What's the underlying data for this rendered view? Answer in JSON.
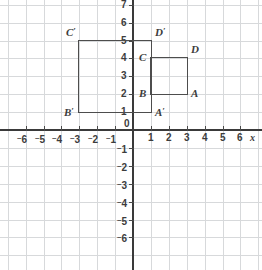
{
  "chart_data": {
    "type": "scatter",
    "title": "",
    "xlabel": "x",
    "ylabel": "",
    "grid": true,
    "legend": null,
    "xlim": [
      -7,
      7
    ],
    "ylim": [
      -7,
      7
    ],
    "x_ticks": [
      "-6",
      "-5",
      "-4",
      "-3",
      "-2",
      "-1",
      "0",
      "1",
      "2",
      "3",
      "4",
      "5",
      "6"
    ],
    "y_ticks": [
      "7",
      "6",
      "5",
      "4",
      "3",
      "2",
      "1",
      "-1",
      "-2",
      "-3",
      "-4",
      "-5",
      "-6"
    ],
    "shapes": [
      {
        "name": "image-square-primed",
        "kind": "rectangle",
        "x_min": -3,
        "x_max": 1,
        "y_min": 1,
        "y_max": 5,
        "vertices": [
          {
            "label": "B",
            "prime": true,
            "x": -3,
            "y": 1
          },
          {
            "label": "C",
            "prime": true,
            "x": -3,
            "y": 5
          },
          {
            "label": "D",
            "prime": true,
            "x": 1,
            "y": 5
          },
          {
            "label": "A",
            "prime": true,
            "x": 1,
            "y": 1
          }
        ]
      },
      {
        "name": "preimage-square",
        "kind": "rectangle",
        "x_min": 1,
        "x_max": 3,
        "y_min": 2,
        "y_max": 4,
        "vertices": [
          {
            "label": "B",
            "prime": false,
            "x": 1,
            "y": 2
          },
          {
            "label": "C",
            "prime": false,
            "x": 1,
            "y": 4
          },
          {
            "label": "D",
            "prime": false,
            "x": 3,
            "y": 4
          },
          {
            "label": "A",
            "prime": false,
            "x": 3,
            "y": 2
          }
        ]
      }
    ],
    "colors": {
      "grid": "#d7d9db",
      "axis": "#3a3a3a",
      "shape_stroke": "#4d4d4d",
      "text": "#3c3c3c",
      "background": "#ffffff"
    }
  },
  "axes": {
    "x_axis_label": "x",
    "origin_label": "0",
    "x_tick_labels": [
      {
        "text": "6",
        "negative": true,
        "value": -6
      },
      {
        "text": "5",
        "negative": true,
        "value": -5
      },
      {
        "text": "4",
        "negative": true,
        "value": -4
      },
      {
        "text": "3",
        "negative": true,
        "value": -3
      },
      {
        "text": "2",
        "negative": true,
        "value": -2
      },
      {
        "text": "1",
        "negative": true,
        "value": -1
      },
      {
        "text": "1",
        "negative": false,
        "value": 1
      },
      {
        "text": "2",
        "negative": false,
        "value": 2
      },
      {
        "text": "3",
        "negative": false,
        "value": 3
      },
      {
        "text": "4",
        "negative": false,
        "value": 4
      },
      {
        "text": "5",
        "negative": false,
        "value": 5
      },
      {
        "text": "6",
        "negative": false,
        "value": 6
      }
    ],
    "y_tick_labels": [
      {
        "text": "7",
        "negative": false,
        "value": 7
      },
      {
        "text": "6",
        "negative": false,
        "value": 6
      },
      {
        "text": "5",
        "negative": false,
        "value": 5
      },
      {
        "text": "4",
        "negative": false,
        "value": 4
      },
      {
        "text": "3",
        "negative": false,
        "value": 3
      },
      {
        "text": "2",
        "negative": false,
        "value": 2
      },
      {
        "text": "1",
        "negative": false,
        "value": 1
      },
      {
        "text": "1",
        "negative": true,
        "value": -1
      },
      {
        "text": "2",
        "negative": true,
        "value": -2
      },
      {
        "text": "3",
        "negative": true,
        "value": -3
      },
      {
        "text": "4",
        "negative": true,
        "value": -4
      },
      {
        "text": "5",
        "negative": true,
        "value": -5
      },
      {
        "text": "6",
        "negative": true,
        "value": -6
      }
    ]
  },
  "labels": {
    "c_prime": "C",
    "d_prime": "D",
    "b_prime": "B",
    "a_prime": "A",
    "c": "C",
    "d": "D",
    "b": "B",
    "a": "A",
    "prime_mark": "′"
  }
}
